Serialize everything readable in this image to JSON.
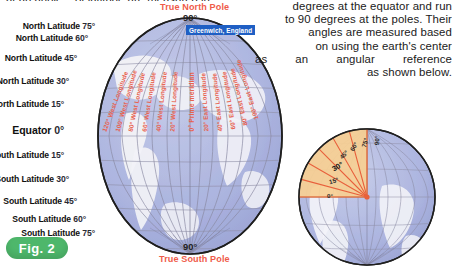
{
  "clipped_top_line": "at an angle... of latitude are measured in",
  "paragraph": {
    "lines": [
      "degrees at the equator and run",
      "to 90 degrees at the poles. Their",
      "angles are measured based",
      "on using the earth's center",
      "as an angular reference",
      "as shown below."
    ]
  },
  "figure": {
    "label": "Fig. 2",
    "badge_color": "#4eb76b"
  },
  "globe": {
    "north_pole_caption": "True North Pole",
    "north_pole_degree": "90°",
    "south_pole_caption": "True South Pole",
    "south_pole_degree": "90°",
    "greenwich_banner": "Greenwich, England",
    "pole_caption_color": "#ef5b4a",
    "longitude_label_color": "#e8614e",
    "ocean_color": "#aeb6e0",
    "land_color": "#f2f2f7",
    "latitudes": [
      {
        "label": "North Latitude",
        "value": "75°"
      },
      {
        "label": "North Latitude",
        "value": "60°"
      },
      {
        "label": "North Latitude",
        "value": "45°"
      },
      {
        "label": "North Latitude",
        "value": "30°"
      },
      {
        "label": "North Latitude",
        "value": "15°"
      },
      {
        "label": "Equator",
        "value": "0°"
      },
      {
        "label": "South Latitude",
        "value": "15°"
      },
      {
        "label": "South Latitude",
        "value": "30°"
      },
      {
        "label": "South Latitude",
        "value": "45°"
      },
      {
        "label": "South Latitude",
        "value": "60°"
      },
      {
        "label": "South Latitude",
        "value": "75°"
      }
    ],
    "longitudes": [
      "120° West Longitude",
      "100° West Longitude",
      "80° West Longitude",
      "60° West Longitude",
      "40° West Longitude",
      "20° West Longitude",
      "0° Prime meridian",
      "20° East Longitude",
      "40° East Longitude",
      "60° East Longitude",
      "80° East Longitude",
      "100° East Longitude"
    ]
  },
  "angle_diagram": {
    "sector_color": "#f6cd8e",
    "ray_color": "#e8603c",
    "angles": [
      "0°",
      "15°",
      "30°",
      "45°",
      "60°",
      "75°",
      "90°"
    ],
    "highlighted": "30°"
  }
}
